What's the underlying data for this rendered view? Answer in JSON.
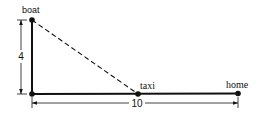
{
  "diagram": {
    "points": {
      "boat": {
        "label": "boat",
        "x": 32,
        "y": 20
      },
      "corner": {
        "label": "",
        "x": 32,
        "y": 94
      },
      "taxi": {
        "label": "taxi",
        "x": 138,
        "y": 94
      },
      "home": {
        "label": "home",
        "x": 238,
        "y": 93
      }
    },
    "dimensions": {
      "vertical": {
        "label": "4"
      },
      "horizontal": {
        "label": "10"
      }
    },
    "colors": {
      "line": "#111111",
      "background": "#ffffff"
    }
  }
}
